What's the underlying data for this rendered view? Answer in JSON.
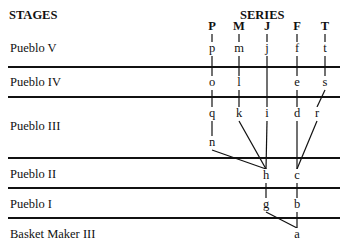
{
  "header": {
    "stages_title": "STAGES",
    "series_title": "SERIES"
  },
  "stages": [
    {
      "key": "pv",
      "label": "Pueblo V"
    },
    {
      "key": "piv",
      "label": "Pueblo IV"
    },
    {
      "key": "piii",
      "label": "Pueblo III"
    },
    {
      "key": "pii",
      "label": "Pueblo II"
    },
    {
      "key": "pi",
      "label": "Pueblo I"
    },
    {
      "key": "bmiii",
      "label": "Basket Maker III"
    }
  ],
  "series": [
    {
      "key": "P",
      "label": "P"
    },
    {
      "key": "M",
      "label": "M"
    },
    {
      "key": "J",
      "label": "J"
    },
    {
      "key": "F",
      "label": "F"
    },
    {
      "key": "T",
      "label": "T"
    }
  ],
  "nodes": [
    {
      "id": "p",
      "series": "P",
      "stage": "pv"
    },
    {
      "id": "m",
      "series": "M",
      "stage": "pv"
    },
    {
      "id": "j",
      "series": "J",
      "stage": "pv"
    },
    {
      "id": "f",
      "series": "F",
      "stage": "pv"
    },
    {
      "id": "t",
      "series": "T",
      "stage": "pv"
    },
    {
      "id": "o",
      "series": "P",
      "stage": "piv"
    },
    {
      "id": "l",
      "series": "M",
      "stage": "piv"
    },
    {
      "id": "e",
      "series": "F",
      "stage": "piv"
    },
    {
      "id": "s",
      "series": "T",
      "stage": "piv"
    },
    {
      "id": "q",
      "series": "P",
      "stage": "piii"
    },
    {
      "id": "k",
      "series": "M",
      "stage": "piii"
    },
    {
      "id": "i",
      "series": "J",
      "stage": "piii"
    },
    {
      "id": "d",
      "series": "F",
      "stage": "piii"
    },
    {
      "id": "r",
      "series": "T",
      "stage": "piii"
    },
    {
      "id": "n",
      "series": "P",
      "stage": "piii"
    },
    {
      "id": "h",
      "series": "J",
      "stage": "pii"
    },
    {
      "id": "c",
      "series": "F",
      "stage": "pii"
    },
    {
      "id": "g",
      "series": "J",
      "stage": "pi"
    },
    {
      "id": "b",
      "series": "F",
      "stage": "pi"
    },
    {
      "id": "a",
      "series": "F",
      "stage": "bmiii"
    }
  ],
  "edges": [
    [
      "P",
      "p"
    ],
    [
      "M",
      "m"
    ],
    [
      "J",
      "j"
    ],
    [
      "F",
      "f"
    ],
    [
      "T",
      "t"
    ],
    [
      "p",
      "o"
    ],
    [
      "m",
      "l"
    ],
    [
      "j",
      "i"
    ],
    [
      "f",
      "e"
    ],
    [
      "t",
      "s"
    ],
    [
      "o",
      "q"
    ],
    [
      "l",
      "k"
    ],
    [
      "e",
      "d"
    ],
    [
      "s",
      "r"
    ],
    [
      "q",
      "n"
    ],
    [
      "n",
      "h"
    ],
    [
      "k",
      "h"
    ],
    [
      "i",
      "h"
    ],
    [
      "d",
      "c"
    ],
    [
      "r",
      "c"
    ],
    [
      "h",
      "g"
    ],
    [
      "c",
      "b"
    ],
    [
      "b",
      "a"
    ],
    [
      "g",
      "a"
    ]
  ]
}
